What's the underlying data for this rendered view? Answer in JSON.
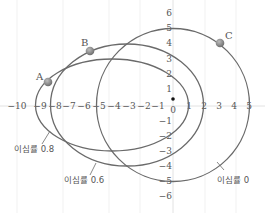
{
  "diagram": {
    "title": "",
    "axes": {
      "x_ticks": [
        "−10",
        "−9",
        "−8",
        "−7",
        "−6",
        "−5",
        "−4",
        "−3",
        "−2",
        "−1",
        "0",
        "1",
        "2",
        "3",
        "4",
        "5"
      ],
      "y_ticks_pos": [
        "6",
        "5",
        "4",
        "3",
        "2",
        "1"
      ],
      "y_ticks_neg": [
        "−1",
        "−2",
        "−3",
        "−4",
        "−5",
        "−6"
      ],
      "origin_label": "0"
    },
    "orbits": [
      {
        "label": "이심률 0",
        "eccentricity": 0,
        "center_x": 0,
        "semi_major": 5,
        "semi_minor": 5
      },
      {
        "label": "이심률 0.6",
        "eccentricity": 0.6,
        "center_x": -3,
        "semi_major": 5,
        "semi_minor": 4
      },
      {
        "label": "이심률 0.8",
        "eccentricity": 0.8,
        "center_x": -4,
        "semi_major": 5,
        "semi_minor": 3
      }
    ],
    "points": [
      {
        "label": "A",
        "x": -8.2,
        "y": 1.5
      },
      {
        "label": "B",
        "x": -5.4,
        "y": 3.5
      },
      {
        "label": "C",
        "x": 3.1,
        "y": 4.0
      }
    ],
    "focus": {
      "x": 0,
      "y": 0.4
    },
    "colors": {
      "orbit": "#666666",
      "axis": "#cccccc",
      "point": "#888888",
      "text": "#555555"
    }
  }
}
